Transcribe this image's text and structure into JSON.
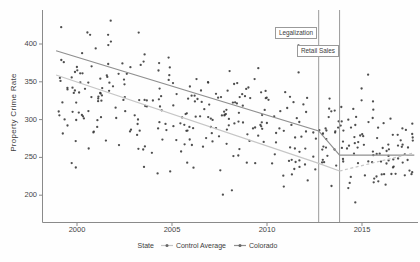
{
  "chart_data": {
    "type": "scatter",
    "title": "",
    "xlabel": "",
    "ylabel": "Property Crime Rate",
    "x_ticks": [
      "2000",
      "2005",
      "2010",
      "2015"
    ],
    "x_tick_years": [
      2000,
      2005,
      2010,
      2015
    ],
    "y_ticks": [
      "200",
      "250",
      "300",
      "350",
      "400"
    ],
    "y_tick_values": [
      200,
      250,
      300,
      350,
      400
    ],
    "xlim": [
      1998.2,
      2017.9
    ],
    "ylim": [
      168,
      445
    ],
    "grid": false,
    "legend": {
      "title": "State",
      "position": "bottom",
      "entries": [
        {
          "label": "Control Average",
          "color": "#c4c4c4"
        },
        {
          "label": "Colorado",
          "color": "#8f8f8f"
        }
      ]
    },
    "vlines": [
      {
        "x": 2012.72,
        "label": "Legalization"
      },
      {
        "x": 2013.82,
        "label": "Retail Sales"
      }
    ],
    "trend_series": [
      {
        "name": "Colorado",
        "color": "#8f8f8f",
        "style": "solid",
        "points": [
          [
            1998.9,
            391
          ],
          [
            2012.72,
            285
          ],
          [
            2013.82,
            253
          ],
          [
            2017.75,
            253
          ]
        ]
      },
      {
        "name": "Control Average",
        "color": "#c6c6c6",
        "style": "solid",
        "points": [
          [
            1998.9,
            359
          ],
          [
            2012.72,
            242
          ],
          [
            2013.82,
            232
          ]
        ]
      },
      {
        "name": "Control Average (post retail sales)",
        "color": "#c6c6c6",
        "style": "dashed",
        "points": [
          [
            2013.82,
            232
          ],
          [
            2017.75,
            256
          ]
        ]
      }
    ],
    "scatter_points": {
      "description": "state-year property crime rates (approximate cloud, declining 1999-2017)",
      "color": "#353535",
      "n": 380,
      "seed": 20121206,
      "x_range": [
        1998.85,
        2017.7
      ],
      "mean_at_1999": 340,
      "mean_slope_per_year": -4.4,
      "sd_at_1999": 42,
      "sd_slope_per_year": -0.6,
      "y_clamp": [
        188,
        436
      ]
    },
    "axis_color": "#8a8a8a",
    "vline_color": "#9a9a9a"
  }
}
